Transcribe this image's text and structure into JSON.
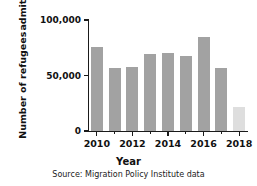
{
  "chart_data": {
    "type": "bar",
    "title": "",
    "xlabel": "Year",
    "ylabel_lines": [
      "Number of refugees",
      "admitted into the USA"
    ],
    "ylabel": "Number of refugees admitted into the USA",
    "categories": [
      2010,
      2011,
      2012,
      2013,
      2014,
      2015,
      2016,
      2017,
      2018
    ],
    "values": [
      76000,
      57000,
      58000,
      69000,
      70000,
      68000,
      85000,
      56500,
      22000
    ],
    "bar_colors": [
      "#a2a2a2",
      "#a2a2a2",
      "#a2a2a2",
      "#a2a2a2",
      "#a2a2a2",
      "#a2a2a2",
      "#a2a2a2",
      "#a2a2a2",
      "#dedede"
    ],
    "ylim": [
      0,
      100000
    ],
    "xlim": [
      2009.5,
      2018.5
    ],
    "yticks": [
      0,
      50000,
      100000
    ],
    "ytick_labels": [
      "0",
      "50,000",
      "100,000"
    ],
    "xticks": [
      2010,
      2011,
      2012,
      2013,
      2014,
      2015,
      2016,
      2017,
      2018
    ],
    "xtick_labels_major": [
      "2010",
      "2012",
      "2014",
      "2016",
      "2018"
    ],
    "xticks_major": [
      2010,
      2012,
      2014,
      2016,
      2018
    ],
    "grid": false,
    "legend": "none",
    "source_note": "Source: Migration Policy Institute data",
    "accent_color": "#a2a2a2",
    "highlight_color": "#dedede",
    "axis_color": "#1a1a1a"
  }
}
